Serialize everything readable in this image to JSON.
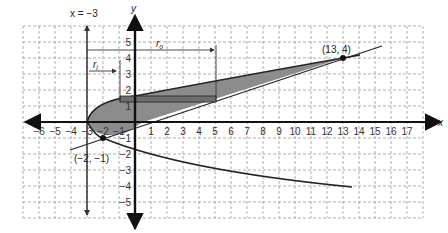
{
  "diagram": {
    "type": "region-between-curves-revolution",
    "axes": {
      "x_label": "x",
      "y_label": "y",
      "x_range": [
        -7,
        18
      ],
      "y_range": [
        -6,
        6
      ],
      "x_ticks": [
        "-6",
        "-5",
        "-4",
        "-3",
        "-2",
        "-1",
        "1",
        "2",
        "3",
        "4",
        "5",
        "6",
        "7",
        "8",
        "9",
        "10",
        "11",
        "12",
        "13",
        "14",
        "15",
        "16",
        "17"
      ],
      "y_ticks": [
        "5",
        "4",
        "3",
        "2",
        "1",
        "-1",
        "-2",
        "-3",
        "-4",
        "-5"
      ],
      "grid": "dashed"
    },
    "axis_of_rotation_label": "x = −3",
    "radius_labels": {
      "inner": "r",
      "inner_sub": "i",
      "outer": "r",
      "outer_sub": "o"
    },
    "points": [
      {
        "label": "(13, 4)",
        "x": 13,
        "y": 4
      },
      {
        "label": "(−2, −1)",
        "x": -2,
        "y": -1
      }
    ],
    "colors": {
      "shaded_region": "#8c8c8c",
      "curves": "#222222",
      "grid": "#9a9a9a"
    }
  }
}
